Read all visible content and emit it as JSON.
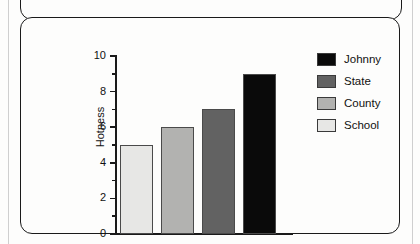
{
  "chart_data": {
    "type": "bar",
    "title": "",
    "subtitle": "",
    "xlabel": "",
    "ylabel": "Hotness",
    "ylim": [
      0,
      10
    ],
    "ytick_labels": [
      "0",
      "2",
      "4",
      "6",
      "8",
      "10"
    ],
    "ytick_values": [
      0,
      2,
      4,
      6,
      8,
      10
    ],
    "yminor_values": [
      1,
      3,
      5,
      7,
      9
    ],
    "grid": false,
    "legend_position": "right",
    "categories": [
      "School",
      "County",
      "State",
      "Johnny"
    ],
    "values": [
      5,
      6,
      7,
      9
    ],
    "bar_colors": [
      "#e7e7e5",
      "#b2b2b0",
      "#626262",
      "#0a0a0a"
    ],
    "bar_edge_color": "#4a4a4a",
    "bars": [
      {
        "name": "School",
        "value": 5,
        "color": "#e7e7e5"
      },
      {
        "name": "County",
        "value": 6,
        "color": "#b2b2b0"
      },
      {
        "name": "State",
        "value": 7,
        "color": "#626262"
      },
      {
        "name": "Johnny",
        "value": 9,
        "color": "#0a0a0a"
      }
    ],
    "legend": [
      {
        "label": "Johnny",
        "color": "#0a0a0a"
      },
      {
        "label": "State",
        "color": "#626262"
      },
      {
        "label": "County",
        "color": "#b2b2b0"
      },
      {
        "label": "School",
        "color": "#e7e7e5"
      }
    ]
  },
  "figure": {
    "panel_border_color": "#1a1a1a",
    "background_color": "#fdfdfc",
    "axis_color": "#1a1a1a"
  }
}
